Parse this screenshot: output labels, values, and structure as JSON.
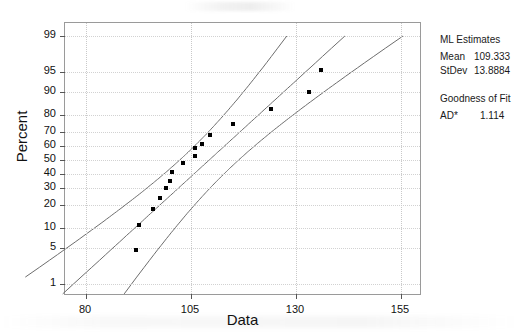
{
  "chart_data": {
    "type": "scatter",
    "title": "",
    "xlabel": "Data",
    "ylabel": "Percent",
    "xlim": [
      75,
      160
    ],
    "ylim_percent": [
      1,
      99
    ],
    "grid": true,
    "x_ticks": [
      80,
      105,
      130,
      155
    ],
    "y_ticks": [
      1,
      5,
      10,
      20,
      30,
      40,
      50,
      60,
      70,
      80,
      90,
      95,
      99
    ],
    "probability_scale": "normal",
    "points": [
      {
        "x": 92.0,
        "percent": 4.5
      },
      {
        "x": 92.5,
        "percent": 11.0
      },
      {
        "x": 96.0,
        "percent": 18.0
      },
      {
        "x": 97.5,
        "percent": 24.0
      },
      {
        "x": 99.0,
        "percent": 30.0
      },
      {
        "x": 100.0,
        "percent": 35.0
      },
      {
        "x": 100.5,
        "percent": 41.0
      },
      {
        "x": 103.0,
        "percent": 48.0
      },
      {
        "x": 106.0,
        "percent": 53.0
      },
      {
        "x": 106.0,
        "percent": 59.0
      },
      {
        "x": 107.5,
        "percent": 62.0
      },
      {
        "x": 109.5,
        "percent": 68.0
      },
      {
        "x": 115.0,
        "percent": 75.0
      },
      {
        "x": 124.0,
        "percent": 83.0
      },
      {
        "x": 133.0,
        "percent": 90.0
      },
      {
        "x": 136.0,
        "percent": 95.5
      }
    ],
    "fit_line": {
      "label": "normal fit line"
    },
    "confidence_bands": {
      "label": "95% confidence interval"
    }
  },
  "axes": {
    "y_title": "Percent",
    "x_title": "Data",
    "y_tick_labels": [
      "99",
      "95",
      "90",
      "80",
      "70",
      "60",
      "50",
      "40",
      "30",
      "20",
      "10",
      "5",
      "1"
    ],
    "x_tick_labels": [
      "80",
      "105",
      "130",
      "155"
    ]
  },
  "info_panel": {
    "ml_estimates_heading": "ML Estimates",
    "mean_label": "Mean",
    "mean_value": "109.333",
    "stdev_label": "StDev",
    "stdev_value": "13.8884",
    "goodness_heading": "Goodness of Fit",
    "ad_label": "AD*",
    "ad_value": "1.114"
  },
  "colors": {
    "point": "#000000",
    "curve": "#6d6d6d",
    "frame": "#9a9a9a",
    "grid": "#c9c9c9",
    "text": "#111111"
  }
}
